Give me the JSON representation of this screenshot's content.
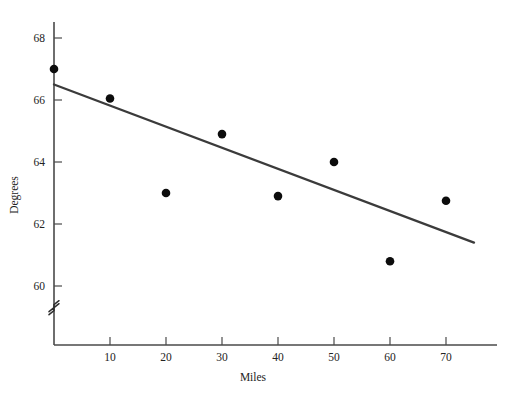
{
  "chart_data": {
    "type": "scatter",
    "title": "",
    "xlabel": "Miles",
    "ylabel": "Degrees",
    "xlim": [
      0,
      75
    ],
    "ylim": [
      58.9,
      68.6
    ],
    "grid": false,
    "legend": null,
    "axis_break": {
      "axis": "y",
      "symbol": "≈",
      "position": 59.3
    },
    "xticks": [
      10,
      20,
      30,
      40,
      50,
      60,
      70
    ],
    "xtick_labels": [
      "10",
      "20",
      "30",
      "40",
      "50",
      "60",
      "70"
    ],
    "yticks": [
      60,
      62,
      64,
      66,
      68
    ],
    "ytick_labels": [
      "60",
      "62",
      "64",
      "66",
      "68"
    ],
    "x": [
      0,
      10,
      20,
      30,
      40,
      50,
      60,
      70
    ],
    "y": [
      67.0,
      66.05,
      63.0,
      64.9,
      62.9,
      64.0,
      60.8,
      62.75
    ],
    "points": [
      {
        "x": 0,
        "y": 67.0
      },
      {
        "x": 10,
        "y": 66.05
      },
      {
        "x": 20,
        "y": 63.0
      },
      {
        "x": 30,
        "y": 64.9
      },
      {
        "x": 40,
        "y": 62.9
      },
      {
        "x": 50,
        "y": 64.0
      },
      {
        "x": 60,
        "y": 60.8
      },
      {
        "x": 70,
        "y": 62.75
      }
    ],
    "series": [
      {
        "name": "observations",
        "type": "scatter",
        "values": [
          67.0,
          66.05,
          63.0,
          64.9,
          62.9,
          64.0,
          60.8,
          62.75
        ]
      },
      {
        "name": "regression-line",
        "type": "line",
        "x": [
          0,
          75
        ],
        "y": [
          66.5,
          61.4
        ]
      }
    ],
    "colors": {
      "point": "#0c0c0c",
      "line": "#3b3b3b",
      "axis": "#4a4a4a",
      "text": "#232323",
      "background": "#ffffff"
    }
  }
}
